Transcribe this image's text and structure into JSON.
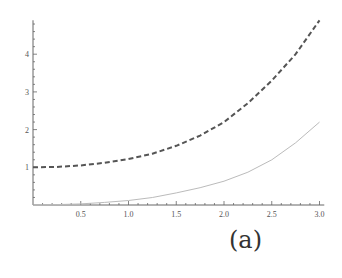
{
  "chart_data": {
    "type": "line",
    "title": "",
    "xlabel": "",
    "ylabel": "",
    "xlim": [
      0,
      3.05
    ],
    "ylim": [
      0,
      4.9
    ],
    "grid": false,
    "legend": null,
    "x_ticks": [
      "0.5",
      "1.0",
      "1.5",
      "2.0",
      "2.5",
      "3.0"
    ],
    "y_ticks": [
      "1",
      "2",
      "3",
      "4"
    ],
    "series": [
      {
        "name": "dashed",
        "style": "dashed",
        "color": "#555555",
        "x": [
          0,
          0.25,
          0.5,
          0.75,
          1.0,
          1.25,
          1.5,
          1.75,
          2.0,
          2.25,
          2.5,
          2.75,
          3.0
        ],
        "y": [
          1.0,
          1.01,
          1.05,
          1.12,
          1.22,
          1.36,
          1.57,
          1.84,
          2.2,
          2.7,
          3.3,
          4.0,
          4.9
        ]
      },
      {
        "name": "solid",
        "style": "solid",
        "color": "#bbbbbb",
        "x": [
          0,
          0.25,
          0.5,
          0.75,
          1.0,
          1.25,
          1.5,
          1.75,
          2.0,
          2.25,
          2.5,
          2.75,
          3.0
        ],
        "y": [
          0.0,
          0.01,
          0.03,
          0.07,
          0.12,
          0.2,
          0.32,
          0.46,
          0.63,
          0.87,
          1.2,
          1.65,
          2.2
        ]
      }
    ],
    "annotations": [
      "(a)"
    ]
  },
  "caption": "(a)"
}
